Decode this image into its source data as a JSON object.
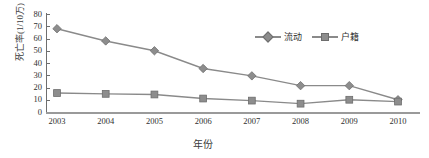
{
  "chart_data": {
    "type": "line",
    "title": "",
    "xlabel": "年份",
    "ylabel": "死亡率(1/10万)",
    "categories": [
      "2003",
      "2004",
      "2005",
      "2006",
      "2007",
      "2008",
      "2009",
      "2010"
    ],
    "series": [
      {
        "name": "流动",
        "marker": "diamond",
        "color": "#8d8d8d",
        "values": [
          68,
          58,
          50,
          35.5,
          29.5,
          21.5,
          21.5,
          10
        ]
      },
      {
        "name": "户籍",
        "marker": "square",
        "color": "#8d8d8d",
        "values": [
          15.5,
          14.8,
          14.3,
          11,
          9.3,
          6.8,
          10,
          8.5
        ]
      }
    ],
    "ylim": [
      0,
      80
    ],
    "yticks": [
      "0",
      "10",
      "20",
      "30",
      "40",
      "50",
      "60",
      "70",
      "80"
    ],
    "grid": false,
    "legend_position": "top-right"
  },
  "axis": {
    "line_color": "#7a7a7a",
    "text_color": "#2f2f2f"
  }
}
